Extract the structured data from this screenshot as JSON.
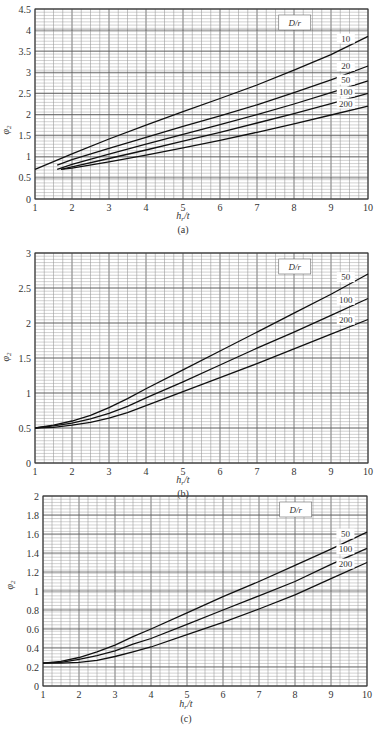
{
  "chart_data": [
    {
      "type": "line",
      "panel": "(a)",
      "xlabel": "h_r/t",
      "ylabel": "φ_2",
      "xlim": [
        1,
        10
      ],
      "ylim": [
        0,
        4.5
      ],
      "xticks": [
        1,
        2,
        3,
        4,
        5,
        6,
        7,
        8,
        9,
        10
      ],
      "yticks": [
        0,
        0.5,
        1,
        1.5,
        2,
        2.5,
        3,
        3.5,
        4,
        4.5
      ],
      "ytick_labels": [
        "0",
        "0.5",
        "1",
        "1.5",
        "2",
        "2.5",
        "3",
        "3.5",
        "4",
        "4.5"
      ],
      "grid": true,
      "legend_title": "D/r",
      "series": [
        {
          "name": "10",
          "x": [
            1,
            2,
            3,
            4,
            5,
            6,
            7,
            8,
            9,
            10
          ],
          "y": [
            0.7,
            1.07,
            1.42,
            1.75,
            2.07,
            2.38,
            2.7,
            3.05,
            3.42,
            3.85
          ]
        },
        {
          "name": "20",
          "x": [
            1.6,
            2,
            3,
            4,
            5,
            6,
            7,
            8,
            9,
            10
          ],
          "y": [
            0.8,
            0.93,
            1.2,
            1.46,
            1.72,
            1.97,
            2.23,
            2.52,
            2.82,
            3.15
          ]
        },
        {
          "name": "50",
          "x": [
            1.6,
            2,
            3,
            4,
            5,
            6,
            7,
            8,
            9,
            10
          ],
          "y": [
            0.7,
            0.82,
            1.06,
            1.3,
            1.53,
            1.76,
            2.0,
            2.25,
            2.52,
            2.8
          ]
        },
        {
          "name": "100",
          "x": [
            1.7,
            2,
            3,
            4,
            5,
            6,
            7,
            8,
            9,
            10
          ],
          "y": [
            0.7,
            0.76,
            0.96,
            1.16,
            1.37,
            1.58,
            1.8,
            2.02,
            2.26,
            2.5
          ]
        },
        {
          "name": "200",
          "x": [
            1.7,
            2,
            3,
            4,
            5,
            6,
            7,
            8,
            9,
            10
          ],
          "y": [
            0.7,
            0.73,
            0.88,
            1.04,
            1.21,
            1.39,
            1.58,
            1.78,
            1.99,
            2.2
          ]
        }
      ]
    },
    {
      "type": "line",
      "panel": "(b)",
      "xlabel": "h_r/t",
      "ylabel": "φ_2",
      "xlim": [
        1,
        10
      ],
      "ylim": [
        0,
        3
      ],
      "xticks": [
        1,
        2,
        3,
        4,
        5,
        6,
        7,
        8,
        9,
        10
      ],
      "yticks": [
        0,
        0.5,
        1,
        1.5,
        2,
        2.5,
        3
      ],
      "ytick_labels": [
        "0",
        "0.5",
        "1",
        "1.5",
        "2",
        "2.5",
        "3"
      ],
      "grid": true,
      "legend_title": "D/r",
      "series": [
        {
          "name": "50",
          "x": [
            1,
            1.5,
            2,
            2.5,
            3,
            3.5,
            4,
            5,
            6,
            7,
            8,
            9,
            10
          ],
          "y": [
            0.5,
            0.54,
            0.6,
            0.68,
            0.79,
            0.92,
            1.06,
            1.33,
            1.6,
            1.87,
            2.14,
            2.41,
            2.7
          ]
        },
        {
          "name": "100",
          "x": [
            1,
            1.5,
            2,
            2.5,
            3,
            3.5,
            4,
            5,
            6,
            7,
            8,
            9,
            10
          ],
          "y": [
            0.5,
            0.53,
            0.57,
            0.63,
            0.71,
            0.81,
            0.93,
            1.16,
            1.4,
            1.64,
            1.87,
            2.11,
            2.35
          ]
        },
        {
          "name": "200",
          "x": [
            1,
            1.5,
            2,
            2.5,
            3,
            3.5,
            4,
            5,
            6,
            7,
            8,
            9,
            10
          ],
          "y": [
            0.5,
            0.51,
            0.54,
            0.58,
            0.64,
            0.72,
            0.82,
            1.02,
            1.22,
            1.42,
            1.63,
            1.84,
            2.05
          ]
        }
      ]
    },
    {
      "type": "line",
      "panel": "(c)",
      "xlabel": "h_r/t",
      "ylabel": "φ_2",
      "xlim": [
        1,
        10
      ],
      "ylim": [
        0,
        2
      ],
      "xticks": [
        1,
        2,
        3,
        4,
        5,
        6,
        7,
        8,
        9,
        10
      ],
      "yticks": [
        0,
        0.2,
        0.4,
        0.6,
        0.8,
        1,
        1.2,
        1.4,
        1.6,
        1.8,
        2
      ],
      "ytick_labels": [
        "0",
        "0.2",
        "0.4",
        "0.6",
        "0.8",
        "1",
        "1.2",
        "1.4",
        "1.6",
        "1.8",
        "2"
      ],
      "grid": true,
      "legend_title": "D/r",
      "series": [
        {
          "name": "50",
          "x": [
            1,
            1.5,
            2,
            2.5,
            3,
            3.5,
            4,
            5,
            6,
            7,
            8,
            9,
            10
          ],
          "y": [
            0.24,
            0.26,
            0.3,
            0.36,
            0.43,
            0.52,
            0.6,
            0.77,
            0.94,
            1.1,
            1.27,
            1.44,
            1.62
          ]
        },
        {
          "name": "100",
          "x": [
            1,
            1.5,
            2,
            2.5,
            3,
            3.5,
            4,
            5,
            6,
            7,
            8,
            9,
            10
          ],
          "y": [
            0.24,
            0.25,
            0.28,
            0.32,
            0.37,
            0.44,
            0.5,
            0.65,
            0.8,
            0.95,
            1.1,
            1.28,
            1.45
          ]
        },
        {
          "name": "200",
          "x": [
            1,
            1.5,
            2,
            2.5,
            3,
            3.5,
            4,
            5,
            6,
            7,
            8,
            9,
            10
          ],
          "y": [
            0.24,
            0.24,
            0.25,
            0.27,
            0.31,
            0.36,
            0.41,
            0.54,
            0.67,
            0.81,
            0.96,
            1.13,
            1.3
          ]
        }
      ]
    }
  ],
  "panels": [
    {
      "label": "(a)",
      "box": {
        "x0": 35,
        "x1": 368,
        "y0": 9,
        "y1": 199
      },
      "xlab_pos": [
        183,
        219
      ],
      "sub_pos": [
        183,
        233
      ],
      "ylab_pos": [
        9,
        130
      ]
    },
    {
      "label": "(b)",
      "box": {
        "x0": 35,
        "x1": 368,
        "y0": 253,
        "y1": 463
      },
      "xlab_pos": [
        183,
        483
      ],
      "sub_pos": [
        183,
        497
      ],
      "ylab_pos": [
        9,
        357
      ]
    },
    {
      "label": "(c)",
      "box": {
        "x0": 43,
        "x1": 367,
        "y0": 496,
        "y1": 686
      },
      "xlab_pos": [
        186,
        707
      ],
      "sub_pos": [
        186,
        722
      ],
      "ylab_pos": [
        13,
        585
      ]
    }
  ]
}
